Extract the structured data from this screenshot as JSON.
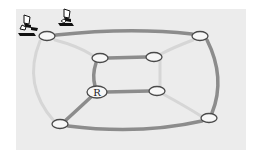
{
  "diagram": {
    "type": "network-topology",
    "colors": {
      "background": "#ececec",
      "active_link": "#8a8a8a",
      "inactive_link": "#d4d4d4",
      "node_fill": "#f6f6f6",
      "node_stroke": "#555555"
    },
    "nodes": [
      {
        "id": "outer-tl",
        "x": 47,
        "y": 36,
        "label": ""
      },
      {
        "id": "outer-tr",
        "x": 200,
        "y": 36,
        "label": ""
      },
      {
        "id": "outer-bl",
        "x": 60,
        "y": 124,
        "label": ""
      },
      {
        "id": "outer-br",
        "x": 209,
        "y": 118,
        "label": ""
      },
      {
        "id": "inner-tl",
        "x": 100,
        "y": 58,
        "label": ""
      },
      {
        "id": "inner-tr",
        "x": 154,
        "y": 57,
        "label": ""
      },
      {
        "id": "inner-bl",
        "x": 97,
        "y": 92,
        "label": "R"
      },
      {
        "id": "inner-br",
        "x": 157,
        "y": 91,
        "label": ""
      }
    ],
    "root_label": "R",
    "hosts": [
      {
        "id": "host-1",
        "icon": "user-at-computer-icon"
      },
      {
        "id": "host-2",
        "icon": "user-at-computer-icon"
      }
    ]
  }
}
